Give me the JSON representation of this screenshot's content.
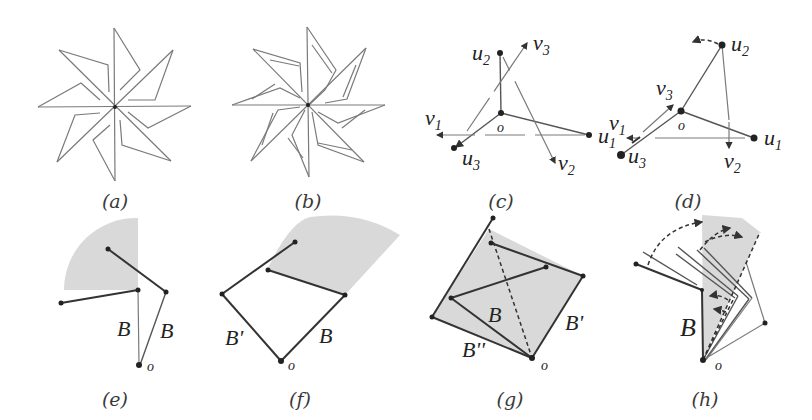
{
  "figure": {
    "panels": [
      {
        "id": "a",
        "caption": "(a)",
        "description": "8-arm pinwheel star linkage, unfolded"
      },
      {
        "id": "b",
        "caption": "(b)",
        "description": "8-arm pinwheel star linkage with inner parallel segments"
      },
      {
        "id": "c",
        "caption": "(c)",
        "description": "Three links from origin o with vectors",
        "labels": {
          "origin": "o",
          "u1": "u",
          "u1_sub": "1",
          "u2": "u",
          "u2_sub": "2",
          "u3": "u",
          "u3_sub": "3",
          "v1": "v",
          "v1_sub": "1",
          "v2": "v",
          "v2_sub": "2",
          "v3": "v",
          "v3_sub": "3"
        }
      },
      {
        "id": "d",
        "caption": "(d)",
        "description": "Three links from origin o after rotation of u2",
        "labels": {
          "origin": "o",
          "u1": "u",
          "u1_sub": "1",
          "u2": "u",
          "u2_sub": "2",
          "u3": "u",
          "u3_sub": "3",
          "v1": "v",
          "v1_sub": "1",
          "v2": "v",
          "v2_sub": "2",
          "v3": "v",
          "v3_sub": "3"
        }
      },
      {
        "id": "e",
        "caption": "(e)",
        "description": "Two bars B with shaded quarter sector",
        "labels": {
          "bar_left": "B",
          "bar_right": "B",
          "origin": "o"
        }
      },
      {
        "id": "f",
        "caption": "(f)",
        "description": "Bars B' and B with shaded sector",
        "labels": {
          "bar_left": "B'",
          "bar_right": "B",
          "origin": "o"
        }
      },
      {
        "id": "g",
        "caption": "(g)",
        "description": "Shaded square region with bars B, B', B''",
        "labels": {
          "bar_inner": "B",
          "bar_right": "B'",
          "bar_bottom": "B''",
          "origin": "o"
        }
      },
      {
        "id": "h",
        "caption": "(h)",
        "description": "Sequence of rotating bars with dashed arc arrows",
        "labels": {
          "bar": "B",
          "origin": "o"
        }
      }
    ]
  }
}
